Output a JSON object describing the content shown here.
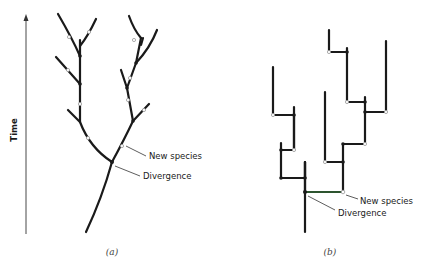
{
  "panels": [
    {
      "id": "a",
      "caption": "(a)",
      "axis_label": "Time",
      "annotations": {
        "new_species": "New species",
        "divergence": "Divergence"
      }
    },
    {
      "id": "b",
      "caption": "(b)",
      "annotations": {
        "new_species": "New species",
        "divergence": "Divergence"
      }
    }
  ],
  "colors": {
    "line": "#1a1a1a",
    "highlight": "#4caf50"
  }
}
